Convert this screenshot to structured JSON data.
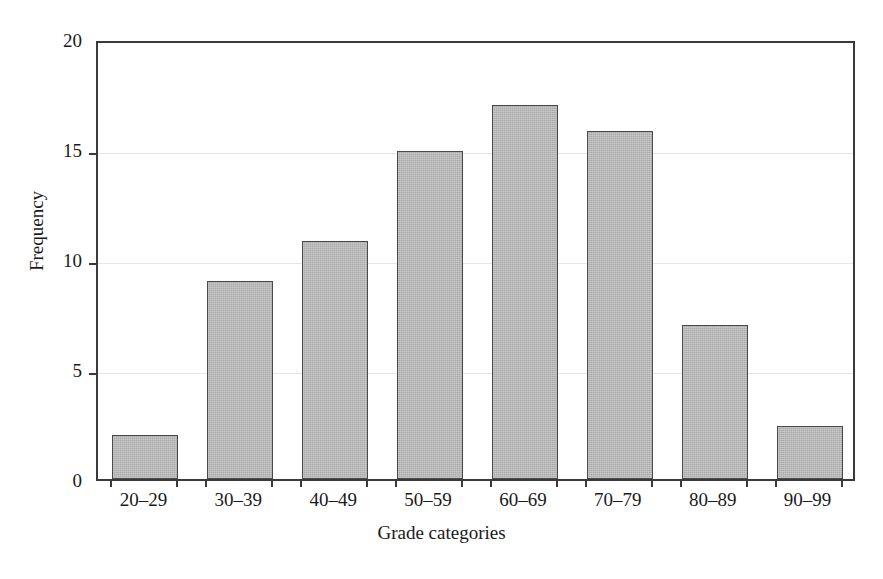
{
  "chart_data": {
    "type": "bar",
    "title": "",
    "xlabel": "Grade categories",
    "ylabel": "Frequency",
    "categories": [
      "20–29",
      "30–39",
      "40–49",
      "50–59",
      "60–69",
      "70–79",
      "80–89",
      "90–99"
    ],
    "values": [
      2,
      9,
      10.8,
      14.9,
      17,
      15.8,
      7,
      2.4
    ],
    "ylim": [
      0,
      20
    ],
    "yticks": [
      0,
      5,
      10,
      15,
      20
    ],
    "ytick_labels": [
      "0",
      "5",
      "10",
      "15",
      "20"
    ],
    "xlim_note": "categorical",
    "grid": "horizontal",
    "legend": "none",
    "colors": {
      "bar_fill": "#aaaaaa",
      "bar_edge": "#4a4a4a",
      "axis": "#3a3a3a",
      "gridline": "#e6e6e6",
      "background": "#ffffff",
      "text": "#1a1a1a"
    }
  }
}
